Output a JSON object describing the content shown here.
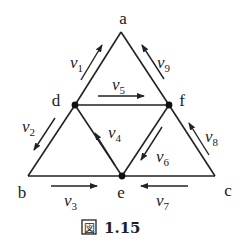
{
  "figure": {
    "caption_icon": "図",
    "caption_number": "1.15",
    "colors": {
      "ink": "#222222",
      "background": "#ffffff"
    }
  },
  "vertices": [
    {
      "id": "a",
      "label": "a",
      "x": 121,
      "y": 32,
      "dot": false,
      "lx": 123,
      "ly": 24
    },
    {
      "id": "b",
      "label": "b",
      "x": 28,
      "y": 176,
      "dot": false,
      "lx": 22,
      "ly": 198
    },
    {
      "id": "c",
      "label": "c",
      "x": 215,
      "y": 176,
      "dot": false,
      "lx": 228,
      "ly": 196
    },
    {
      "id": "d",
      "label": "d",
      "x": 75,
      "y": 105,
      "dot": true,
      "lx": 56,
      "ly": 106
    },
    {
      "id": "e",
      "label": "e",
      "x": 122,
      "y": 176,
      "dot": true,
      "lx": 121,
      "ly": 198
    },
    {
      "id": "f",
      "label": "f",
      "x": 169,
      "y": 105,
      "dot": true,
      "lx": 182,
      "ly": 106
    }
  ],
  "edges": [
    [
      "a",
      "d"
    ],
    [
      "d",
      "b"
    ],
    [
      "b",
      "e"
    ],
    [
      "e",
      "c"
    ],
    [
      "c",
      "f"
    ],
    [
      "f",
      "a"
    ],
    [
      "d",
      "f"
    ],
    [
      "d",
      "e"
    ],
    [
      "e",
      "f"
    ]
  ],
  "flows": [
    {
      "name": "v",
      "sub": "1",
      "from": [
        81,
        80
      ],
      "to": [
        102,
        45
      ],
      "lx": 70,
      "ly": 68
    },
    {
      "name": "v",
      "sub": "2",
      "from": [
        55,
        118
      ],
      "to": [
        34,
        150
      ],
      "lx": 22,
      "ly": 132
    },
    {
      "name": "v",
      "sub": "3",
      "from": [
        51,
        186
      ],
      "to": [
        97,
        186
      ],
      "lx": 64,
      "ly": 206
    },
    {
      "name": "v",
      "sub": "4",
      "from": [
        115,
        165
      ],
      "to": [
        95,
        133
      ],
      "lx": 108,
      "ly": 138
    },
    {
      "name": "v",
      "sub": "5",
      "from": [
        98,
        96
      ],
      "to": [
        144,
        96
      ],
      "lx": 112,
      "ly": 90
    },
    {
      "name": "v",
      "sub": "6",
      "from": [
        162,
        127
      ],
      "to": [
        141,
        160
      ],
      "lx": 156,
      "ly": 162
    },
    {
      "name": "v",
      "sub": "7",
      "from": [
        188,
        186
      ],
      "to": [
        141,
        186
      ],
      "lx": 156,
      "ly": 206
    },
    {
      "name": "v",
      "sub": "8",
      "from": [
        209,
        155
      ],
      "to": [
        189,
        123
      ],
      "lx": 205,
      "ly": 142
    },
    {
      "name": "v",
      "sub": "9",
      "from": [
        164,
        79
      ],
      "to": [
        142,
        45
      ],
      "lx": 157,
      "ly": 68
    }
  ]
}
